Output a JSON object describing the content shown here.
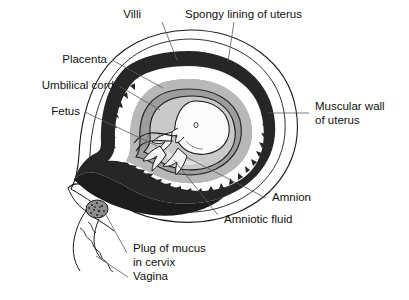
{
  "figure": {
    "background_color": "#ffffff",
    "ink_color": "#111111",
    "leader_color": "#5a5a5a",
    "palette": {
      "endometrium_dark": "#262626",
      "placenta_dark": "#1c1c1c",
      "amnion_grey": "#b8b8b8",
      "fluid_grey": "#9d9d9d",
      "fetus_white": "#fbfbfb",
      "fetus_shade": "#c9c9c9",
      "mucus_plug": "#7a7a7a",
      "uterus_wall": "#ffffff"
    }
  },
  "labels": {
    "villi": "Villi",
    "spongy_lining": "Spongy lining of uterus",
    "placenta": "Placenta",
    "umbilical_cord": "Umbilical cord",
    "fetus": "Fetus",
    "muscular_wall_line1": "Muscular wall",
    "muscular_wall_line2": "of uterus",
    "amnion": "Amnion",
    "amniotic_fluid": "Amniotic fluid",
    "mucus_plug_line1": "Plug of mucus",
    "mucus_plug_line2": "in cervix",
    "vagina": "Vagina"
  },
  "parts": [
    {
      "key": "villi",
      "name": "villi",
      "label": "Villi"
    },
    {
      "key": "spongy_lining",
      "name": "spongy-lining-of-uterus",
      "label": "Spongy lining of uterus"
    },
    {
      "key": "placenta",
      "name": "placenta",
      "label": "Placenta"
    },
    {
      "key": "umbilical_cord",
      "name": "umbilical-cord",
      "label": "Umbilical cord"
    },
    {
      "key": "fetus",
      "name": "fetus",
      "label": "Fetus"
    },
    {
      "key": "muscular_wall",
      "name": "muscular-wall-of-uterus",
      "label": "Muscular wall of uterus"
    },
    {
      "key": "amnion",
      "name": "amnion",
      "label": "Amnion"
    },
    {
      "key": "amniotic_fluid",
      "name": "amniotic-fluid",
      "label": "Amniotic fluid"
    },
    {
      "key": "mucus_plug",
      "name": "plug-of-mucus-in-cervix",
      "label": "Plug of mucus in cervix"
    },
    {
      "key": "vagina",
      "name": "vagina",
      "label": "Vagina"
    }
  ]
}
